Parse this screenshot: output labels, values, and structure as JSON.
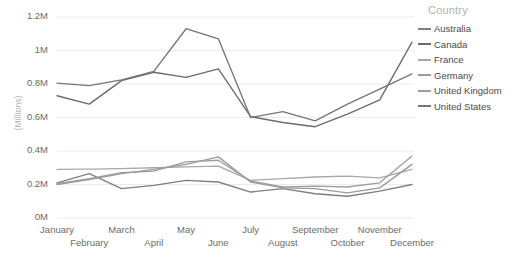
{
  "chart_data": {
    "type": "line",
    "title": "",
    "xlabel": "",
    "ylabel": "(Millions)",
    "ylim": [
      0,
      1200000
    ],
    "yticks": [
      "0M",
      "0.2M",
      "0.4M",
      "0.6M",
      "0.8M",
      "1M",
      "1.2M"
    ],
    "ytick_values": [
      0,
      200000,
      400000,
      600000,
      800000,
      1000000,
      1200000
    ],
    "grid": true,
    "grid_axis": "y",
    "legend_position": "right",
    "legend_title": "Country",
    "categories": [
      "January",
      "February",
      "March",
      "April",
      "May",
      "June",
      "July",
      "August",
      "September",
      "October",
      "November",
      "December"
    ],
    "series": [
      {
        "name": "Australia",
        "color": "#7f7f7f",
        "values": [
          210000,
          265000,
          175000,
          195000,
          225000,
          215000,
          155000,
          175000,
          145000,
          130000,
          160000,
          200000
        ]
      },
      {
        "name": "Canada",
        "color": "#6b6b6b",
        "values": [
          730000,
          680000,
          820000,
          870000,
          840000,
          890000,
          605000,
          570000,
          545000,
          620000,
          705000,
          1050000
        ]
      },
      {
        "name": "France",
        "color": "#a8a8a8",
        "values": [
          290000,
          292000,
          295000,
          300000,
          305000,
          310000,
          225000,
          235000,
          245000,
          250000,
          240000,
          290000
        ]
      },
      {
        "name": "Germany",
        "color": "#9a9a9a",
        "values": [
          200000,
          230000,
          265000,
          290000,
          320000,
          365000,
          215000,
          180000,
          175000,
          150000,
          180000,
          320000
        ]
      },
      {
        "name": "United Kingdom",
        "color": "#9e9e9e",
        "values": [
          205000,
          235000,
          270000,
          280000,
          335000,
          345000,
          220000,
          185000,
          190000,
          185000,
          210000,
          370000
        ]
      },
      {
        "name": "United States",
        "color": "#767676",
        "values": [
          805000,
          790000,
          825000,
          875000,
          1130000,
          1070000,
          600000,
          635000,
          580000,
          680000,
          770000,
          860000
        ]
      }
    ]
  },
  "legend": {
    "title": "Country",
    "items": [
      {
        "label": "Australia"
      },
      {
        "label": "Canada"
      },
      {
        "label": "France"
      },
      {
        "label": "Germany"
      },
      {
        "label": "United Kingdom"
      },
      {
        "label": "United States"
      }
    ]
  },
  "axes": {
    "y_axis_title": "(Millions)"
  }
}
